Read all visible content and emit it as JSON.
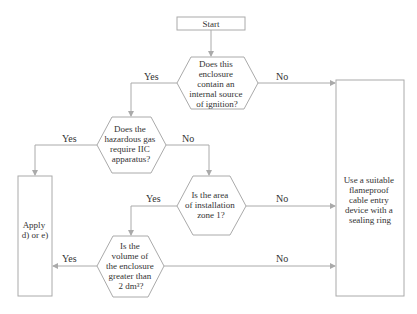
{
  "nodes": {
    "start": {
      "label": "Start"
    },
    "q1": {
      "lines": [
        "Does this",
        "enclosure",
        "contain an",
        "internal source",
        "of ignition?"
      ]
    },
    "q2": {
      "lines": [
        "Does the",
        "hazardous gas",
        "require IIC",
        "apparatus?"
      ]
    },
    "q3": {
      "lines": [
        "Is the area",
        "of installation",
        "zone 1?"
      ]
    },
    "q4": {
      "lines": [
        "Is the",
        "volume of",
        "the enclosure",
        "greater than",
        "2 dm³?"
      ]
    },
    "apply": {
      "lines": [
        "Apply",
        "d) or e)"
      ]
    },
    "use": {
      "lines": [
        "Use a suitable",
        "flameproof",
        "cable entry",
        "device with a",
        "sealing ring"
      ]
    }
  },
  "edges": {
    "q1_yes": "Yes",
    "q1_no": "No",
    "q2_yes": "Yes",
    "q2_no": "No",
    "q3_yes": "Yes",
    "q3_no": "No",
    "q4_yes": "Yes",
    "q4_no": "No"
  },
  "colors": {
    "stroke": "#aaaaaa",
    "text": "#333333"
  }
}
